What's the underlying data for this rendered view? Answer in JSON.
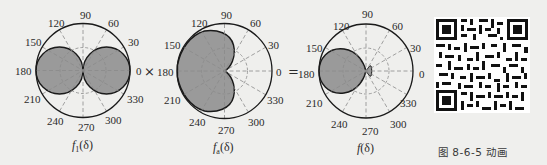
{
  "figure": {
    "caption": "图 8-6-5 动画",
    "operators": [
      "×",
      "="
    ],
    "angle_ticks": [
      "0",
      "30",
      "60",
      "90",
      "120",
      "150",
      "180",
      "210",
      "240",
      "270",
      "300",
      "330"
    ],
    "plots": [
      {
        "id": "f1",
        "label_main": "f",
        "label_sub": "1",
        "label_arg": "(δ)",
        "shape": "figure-eight (two lobes at 0° and 180°)",
        "fill_color": "#9a9a9a"
      },
      {
        "id": "fa",
        "label_main": "f",
        "label_sub": "a",
        "label_arg": "(δ)",
        "shape": "cardioid pointing to 180°",
        "fill_color": "#9a9a9a"
      },
      {
        "id": "f",
        "label_main": "f",
        "label_sub": "",
        "label_arg": "(δ)",
        "shape": "main lobe at 180° with small back lobe at 0°",
        "fill_color": "#9a9a9a"
      }
    ],
    "qr_code": {
      "description": "QR code linking to animation"
    }
  },
  "colors": {
    "background": "#efefed",
    "outline": "#1a1a1a",
    "lobe_fill": "#9a9a9a",
    "grid": "#8a8a8a"
  }
}
